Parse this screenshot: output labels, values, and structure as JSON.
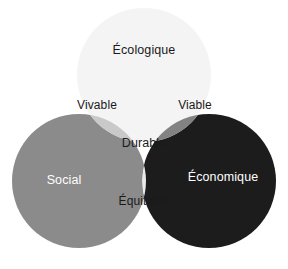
{
  "diagram": {
    "type": "venn-3",
    "background_color": "#ffffff",
    "canvas": {
      "width": 288,
      "height": 269
    },
    "circles": [
      {
        "id": "ecologique",
        "label": "Écologique",
        "cx": 144,
        "cy": 75,
        "r": 67,
        "fill": "#f4f4f4",
        "text_color": "#1a1a1a",
        "label_x": 144,
        "label_y": 50
      },
      {
        "id": "social",
        "label": "Social",
        "cx": 79,
        "cy": 181,
        "r": 67,
        "fill": "#8b8b8b",
        "text_color": "#ffffff",
        "label_x": 64,
        "label_y": 180
      },
      {
        "id": "economique",
        "label": "Économique",
        "cx": 209,
        "cy": 181,
        "r": 67,
        "fill": "#1c1c1c",
        "text_color": "#ffffff",
        "label_x": 223,
        "label_y": 177
      }
    ],
    "intersections": [
      {
        "id": "vivable",
        "label": "Vivable",
        "of": [
          "ecologique",
          "social"
        ],
        "fill": "#c9c9c9",
        "text_color": "#1a1a1a",
        "label_x": 97,
        "label_y": 105
      },
      {
        "id": "viable",
        "label": "Viable",
        "of": [
          "ecologique",
          "economique"
        ],
        "fill": "#828282",
        "text_color": "#1a1a1a",
        "label_x": 195,
        "label_y": 105
      },
      {
        "id": "equitable",
        "label": "Équitable",
        "of": [
          "social",
          "economique"
        ],
        "fill": "#eaeaea",
        "text_color": "#1a1a1a",
        "label_x": 144,
        "label_y": 201
      }
    ],
    "center": {
      "id": "durable",
      "label": "Durable",
      "of": [
        "ecologique",
        "social",
        "economique"
      ],
      "fill": "#ffffff",
      "text_color": "#1a1a1a",
      "label_x": 144,
      "label_y": 143
    }
  }
}
